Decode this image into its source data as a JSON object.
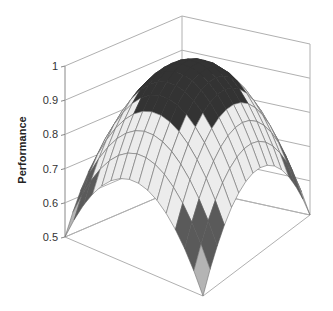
{
  "chart_data": {
    "type": "surface",
    "title": "",
    "xlabel": "",
    "ylabel": "",
    "zlabel": "Performance",
    "zlim": [
      0.5,
      1
    ],
    "z_ticks": [
      "0.5",
      "0.6",
      "0.7",
      "0.8",
      "0.9",
      "1"
    ],
    "grid": true,
    "legend": "none",
    "grid_size": 15,
    "surface_function": "dome: z = 1 - 0.5 * r^2 over square domain [-1,1]x[-1,1], clipped at 0.5",
    "peak_value": 1.0,
    "corner_value": 0.5,
    "color_bands": [
      {
        "range": [
          0.5,
          0.6
        ],
        "color": "#b4b4b4"
      },
      {
        "range": [
          0.6,
          0.7
        ],
        "color": "#5a5a5a"
      },
      {
        "range": [
          0.7,
          0.8
        ],
        "color": "#ececec"
      },
      {
        "range": [
          0.8,
          0.9
        ],
        "color": "#ececec"
      },
      {
        "range": [
          0.9,
          1.0
        ],
        "color": "#333333"
      }
    ]
  },
  "colors": {
    "background": "#ffffff",
    "wall_line": "#b0b0b0",
    "axis_line": "#888888",
    "mesh_line": "#6e6e6e"
  }
}
